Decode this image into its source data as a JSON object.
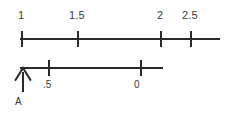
{
  "diagram": {
    "colors": {
      "line": "#2b2b2b",
      "text": "#3a3a3a",
      "background": "#ffffff"
    },
    "top_axis": {
      "name": "upper-number-line",
      "start_x": 20,
      "end_x": 220,
      "y": 38,
      "ticks": [
        {
          "label": "1",
          "x": 21,
          "label_x": 18,
          "label_y": 10
        },
        {
          "label": "1.5",
          "x": 77,
          "label_x": 69,
          "label_y": 10
        },
        {
          "label": "2",
          "x": 160,
          "label_x": 157,
          "label_y": 10
        },
        {
          "label": "2.5",
          "x": 190,
          "label_x": 182,
          "label_y": 10
        }
      ]
    },
    "bottom_axis": {
      "name": "lower-number-line",
      "start_x": 20,
      "end_x": 163,
      "y": 67,
      "ticks": [
        {
          "label": ".5",
          "x": 48,
          "label_x": 43,
          "label_y": 80
        },
        {
          "label": "0",
          "x": 140,
          "label_x": 134,
          "label_y": 80
        }
      ]
    },
    "marker": {
      "name": "marker-A",
      "label": "A",
      "x": 22,
      "shaft_top": 68,
      "shaft_bottom": 92,
      "label_x": 15,
      "label_y": 97
    }
  }
}
